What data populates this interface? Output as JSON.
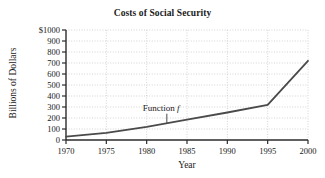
{
  "chart_data": {
    "type": "line",
    "title": "Costs of Social Security",
    "xlabel": "Year",
    "ylabel": "Billions of Dollars",
    "xlim": [
      1970,
      2000
    ],
    "ylim": [
      0,
      1000
    ],
    "grid": true,
    "legend": "none",
    "xticks": [
      1970,
      1975,
      1980,
      1985,
      1990,
      1995,
      2000
    ],
    "xtick_labels": [
      "1970",
      "1975",
      "1980",
      "1985",
      "1990",
      "1995",
      "2000"
    ],
    "yticks": [
      0,
      100,
      200,
      300,
      400,
      500,
      600,
      700,
      800,
      900,
      1000
    ],
    "ytick_labels": [
      "0",
      "100",
      "200",
      "300",
      "400",
      "500",
      "600",
      "700",
      "800",
      "900",
      "$1000"
    ],
    "series": [
      {
        "name": "Function f",
        "color": "#4a4a4a",
        "x": [
          1970,
          1975,
          1980,
          1985,
          1990,
          1995,
          2000
        ],
        "values": [
          30,
          65,
          120,
          185,
          250,
          320,
          720
        ]
      }
    ],
    "annotations": [
      {
        "text_prefix": "Function ",
        "text_italic": "f",
        "x": 1982.5,
        "y": 230,
        "points_to_x": 1982.5,
        "points_to_y": 155
      }
    ]
  },
  "colors": {
    "curve": "#4a4a4a",
    "axis": "#2b2b2b",
    "grid": "#c9c9c9",
    "background": "#ffffff",
    "text": "#1a1a1a"
  }
}
